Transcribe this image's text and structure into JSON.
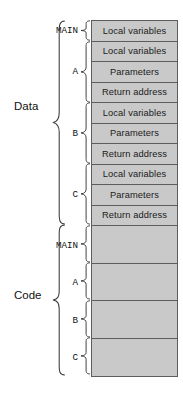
{
  "diagram": {
    "colors": {
      "cell_fill": "#c9c9c9",
      "cell_border": "#5d5d5d",
      "brace_stroke": "#3a3a3a",
      "text": "#111111",
      "background": "#ffffff"
    },
    "sections": [
      {
        "key": "data",
        "label": "Data",
        "groups": [
          {
            "key": "main",
            "label": "MAIN",
            "rows": [
              "Local variables"
            ]
          },
          {
            "key": "a",
            "label": "A",
            "rows": [
              "Local variables",
              "Parameters",
              "Return address"
            ]
          },
          {
            "key": "b",
            "label": "B",
            "rows": [
              "Local variables",
              "Parameters",
              "Return address"
            ]
          },
          {
            "key": "c",
            "label": "C",
            "rows": [
              "Local variables",
              "Parameters",
              "Return address"
            ]
          }
        ]
      },
      {
        "key": "code",
        "label": "Code",
        "groups": [
          {
            "key": "main",
            "label": "MAIN",
            "rows": [
              ""
            ]
          },
          {
            "key": "a",
            "label": "A",
            "rows": [
              ""
            ]
          },
          {
            "key": "b",
            "label": "B",
            "rows": [
              ""
            ]
          },
          {
            "key": "c",
            "label": "C",
            "rows": [
              ""
            ]
          }
        ]
      }
    ]
  }
}
